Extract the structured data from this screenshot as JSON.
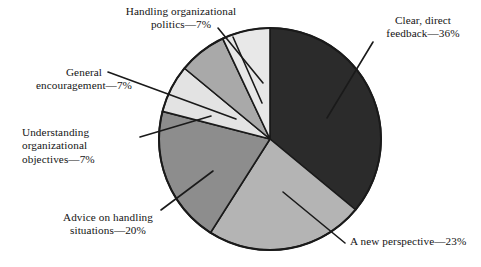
{
  "chart_data": {
    "type": "pie",
    "title": "",
    "subtitle": "",
    "xlabel": "",
    "ylabel": "",
    "legend_position": "none",
    "grid": false,
    "units": "percent",
    "start_angle_deg": 0,
    "direction": "clockwise",
    "categories": [
      "Clear, direct feedback",
      "A new perspective",
      "Advice on handling situations",
      "Understanding organizational objectives",
      "General encouragement",
      "Handling organizational politics"
    ],
    "values": [
      36,
      23,
      20,
      7,
      7,
      7
    ],
    "slices": [
      {
        "label": "Clear, direct feedback",
        "value": 36,
        "percent_text": "36%",
        "callout_text": "Clear, direct\nfeedback—36%",
        "color": "#2b2b2b"
      },
      {
        "label": "A new perspective",
        "value": 23,
        "percent_text": "23%",
        "callout_text": "A new perspective—23%",
        "color": "#b4b4b4"
      },
      {
        "label": "Advice on handling situations",
        "value": 20,
        "percent_text": "20%",
        "callout_text": "Advice on handling\nsituations—20%",
        "color": "#8d8d8d"
      },
      {
        "label": "Understanding organizational objectives",
        "value": 7,
        "percent_text": "7%",
        "callout_text": "Understanding\norganizational\nobjectives—7%",
        "color": "#e3e3e3"
      },
      {
        "label": "General encouragement",
        "value": 7,
        "percent_text": "7%",
        "callout_text": "General\nencouragement—7%",
        "color": "#a9a9a9"
      },
      {
        "label": "Handling organizational politics",
        "value": 7,
        "percent_text": "7%",
        "callout_text": "Handling organizational\npolitics—7%",
        "color": "#e8e8e8"
      }
    ],
    "colors": {
      "outline": "#1a1a1a",
      "leader_line": "#1a1a1a",
      "text": "#141414",
      "background": "#ffffff"
    }
  }
}
